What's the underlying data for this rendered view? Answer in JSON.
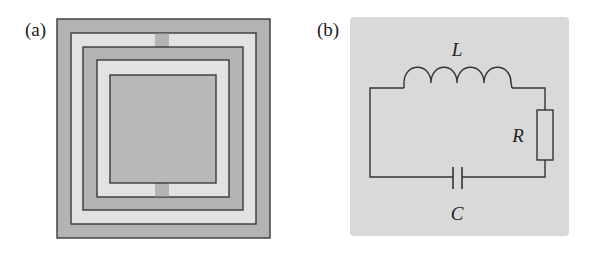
{
  "panels": {
    "a": {
      "label": "(a)",
      "description": "Concentric square split-ring resonator layout",
      "colors": {
        "dark_fill": "#b3b3b3",
        "light_fill": "#e2e2e2",
        "inner_fill": "#b8b8b8",
        "stroke": "#3a3a3a"
      }
    },
    "b": {
      "label": "(b)",
      "description": "Equivalent RLC series circuit",
      "background": "#d9d9d9",
      "components": {
        "inductor": "L",
        "resistor": "R",
        "capacitor": "C"
      }
    }
  }
}
